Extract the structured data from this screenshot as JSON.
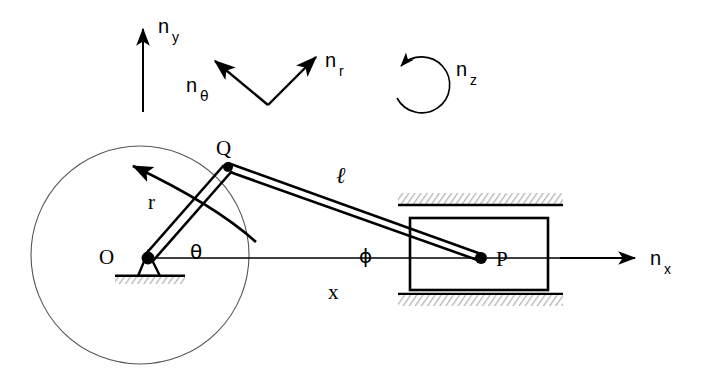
{
  "figure": {
    "background_color": "#ffffff",
    "stroke_color": "#000000",
    "rail_fill_color": "#c8c8c8",
    "width": 706,
    "height": 386
  },
  "basis_vectors": {
    "n_y": {
      "symbol": "n",
      "subscript": "y",
      "icon": "arrow-up-icon",
      "arrow_tail": [
        143,
        112
      ],
      "arrow_head": [
        143,
        27
      ],
      "label_pos": [
        158,
        33
      ]
    },
    "n_theta": {
      "symbol": "n",
      "subscript": "θ",
      "icon": "arrow-up-left-icon",
      "arrow_tail": [
        268,
        105
      ],
      "arrow_head": [
        213,
        59
      ],
      "label_pos": [
        186,
        86
      ]
    },
    "n_r": {
      "symbol": "n",
      "subscript": "r",
      "icon": "arrow-up-right-icon",
      "arrow_tail": [
        268,
        105
      ],
      "arrow_head": [
        318,
        55
      ],
      "label_pos": [
        325,
        65
      ]
    },
    "n_z": {
      "symbol": "n",
      "subscript": "z",
      "icon": "circular-arrow-icon",
      "center": [
        417,
        83
      ],
      "radius": 28,
      "label_pos": [
        456,
        73
      ]
    },
    "n_x": {
      "symbol": "n",
      "subscript": "x",
      "icon": "arrow-right-icon",
      "arrow_tail": [
        560,
        258
      ],
      "arrow_head": [
        637,
        258
      ],
      "label_pos": [
        650,
        265
      ]
    }
  },
  "mechanism": {
    "crank_circle": {
      "name": "crank-path-circle",
      "center": [
        140,
        255
      ],
      "radius": 109
    },
    "pivot_O": {
      "label": "O",
      "label_pos": [
        106,
        257
      ],
      "point": [
        148,
        258
      ],
      "pin_radius": 6,
      "support_top": [
        148,
        252
      ],
      "ground_line": {
        "x1": 115,
        "x2": 185,
        "y": 276
      },
      "hatch_band": {
        "x": 115,
        "y": 276,
        "width": 70,
        "height": 7
      }
    },
    "crank_point_Q": {
      "label": "Q",
      "label_pos": [
        222,
        148
      ],
      "point": [
        228,
        167
      ],
      "pin_radius": 5
    },
    "slider_point_P": {
      "label": "P",
      "label_pos": [
        502,
        266
      ],
      "point": [
        481,
        258
      ],
      "pin_radius": 6
    },
    "crank_arm": {
      "label": "r",
      "label_pos": [
        152,
        202
      ],
      "from": [
        148,
        258
      ],
      "to": [
        228,
        167
      ]
    },
    "connecting_rod": {
      "label": "ℓ",
      "label_pos": [
        343,
        175
      ],
      "from": [
        228,
        167
      ],
      "to": [
        481,
        258
      ]
    },
    "crank_angle": {
      "label": "θ",
      "label_pos": [
        196,
        252
      ],
      "vertex": [
        148,
        258
      ]
    },
    "rod_angle": {
      "label": "ϕ",
      "label_pos": [
        365,
        256
      ],
      "vertex": [
        481,
        258
      ]
    },
    "displacement": {
      "label": "x",
      "label_pos": [
        333,
        292
      ],
      "from": [
        148,
        258
      ],
      "to": [
        481,
        258
      ]
    },
    "velocity_arc": {
      "name": "crank-velocity-arc",
      "from": [
        255,
        240
      ],
      "to": [
        130,
        163
      ],
      "icon": "curved-arrow-icon"
    },
    "slider_block": {
      "name": "slider-block-P",
      "x": 410,
      "y": 218,
      "width": 138,
      "height": 72
    },
    "guide_rail_top": {
      "name": "guide-rail-top",
      "line": {
        "x1": 398,
        "x2": 563,
        "y": 205
      },
      "hatch_band": {
        "x": 398,
        "y": 193,
        "width": 165,
        "height": 11
      }
    },
    "guide_rail_bottom": {
      "name": "guide-rail-bottom",
      "line": {
        "x1": 398,
        "x2": 563,
        "y": 294
      },
      "hatch_band": {
        "x": 398,
        "y": 295,
        "width": 165,
        "height": 11
      }
    },
    "baseline": {
      "name": "horizontal-reference-axis",
      "from": [
        148,
        258
      ],
      "to": [
        560,
        258
      ]
    }
  }
}
